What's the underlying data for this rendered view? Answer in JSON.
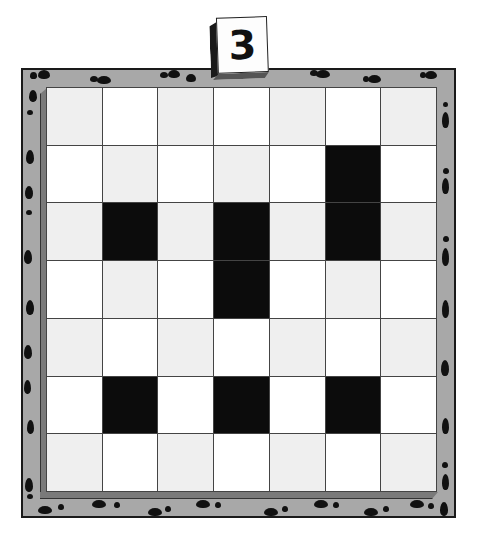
{
  "puzzle": {
    "level_number": "3",
    "rows": 7,
    "cols": 7,
    "colors": {
      "frame": "#a8a8a8",
      "light_cell": "#efefef",
      "white_cell": "#ffffff",
      "black_cell": "#0c0c0c"
    },
    "black_cells": [
      [
        1,
        5
      ],
      [
        2,
        1
      ],
      [
        2,
        3
      ],
      [
        2,
        5
      ],
      [
        3,
        3
      ],
      [
        5,
        1
      ],
      [
        5,
        3
      ],
      [
        5,
        5
      ]
    ],
    "frame_decoration": "footprints-icon"
  }
}
